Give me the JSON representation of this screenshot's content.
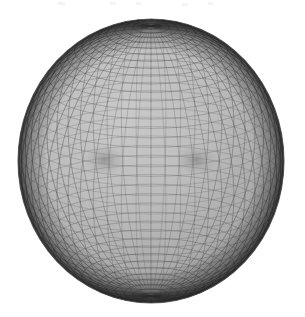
{
  "figure": {
    "kind": "wireframe-mesh-render",
    "background_color": "#ffffff",
    "surface_fill_color": "#b4b4b4",
    "mesh_line_color": "#4a4a4a",
    "rim_shadow_color": "#3a3a3a",
    "highlight_color": "#c8c8c8"
  },
  "geometry": {
    "center_x": 151,
    "center_y": 161,
    "radius_x": 133,
    "radius_y": 142,
    "bounds": {
      "left": 18,
      "top": 20,
      "right": 284,
      "bottom": 303
    },
    "focal_points": [
      {
        "name": "umbilic-left",
        "x": 105,
        "y": 160
      },
      {
        "name": "umbilic-right",
        "x": 196,
        "y": 160
      }
    ],
    "parallels": 46,
    "meridians": 56,
    "view_elevation_deg": 18,
    "view_azimuth_deg": 0
  },
  "shading": {
    "ambient": 0.55,
    "rim_darkening": 0.62,
    "light_direction": "top-left",
    "line_opacity_center": 0.42,
    "line_opacity_rim": 0.9
  },
  "chart_data": {
    "type": "scatter",
    "title": "",
    "xlabel": "",
    "ylabel": "",
    "grid": true,
    "legend": "none",
    "surface": "sphere-like quadrilateral mesh",
    "u_samples": 56,
    "v_samples": 46
  },
  "artifacts": {
    "top_marks": [
      {
        "x": 58,
        "y": 2,
        "w": 7
      },
      {
        "x": 110,
        "y": 2,
        "w": 6
      },
      {
        "x": 136,
        "y": 2,
        "w": 5
      },
      {
        "x": 182,
        "y": 3,
        "w": 6
      },
      {
        "x": 208,
        "y": 2,
        "w": 5
      }
    ]
  }
}
